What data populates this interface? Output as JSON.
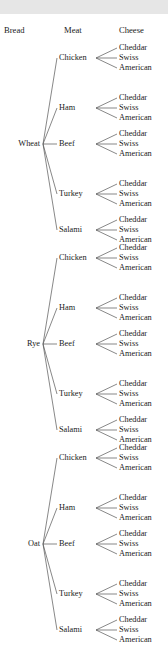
{
  "diagram": {
    "headers": [
      {
        "id": "bread",
        "label": "Bread"
      },
      {
        "id": "meat",
        "label": "Meat"
      },
      {
        "id": "cheese",
        "label": "Cheese"
      }
    ],
    "breads": [
      "Wheat",
      "Rye",
      "Oat"
    ],
    "meats": [
      "Chicken",
      "Ham",
      "Beef",
      "Turkey",
      "Salami"
    ],
    "cheeses": [
      "Cheddar",
      "Swiss",
      "American"
    ],
    "counts": {
      "breads": 3,
      "meats": 5,
      "cheeses": 3,
      "total_leaves": 45
    },
    "colors": {
      "line": "#555555",
      "text": "#1a1a1a",
      "background": "#ffffff",
      "topband": "#e6e6e6"
    }
  }
}
